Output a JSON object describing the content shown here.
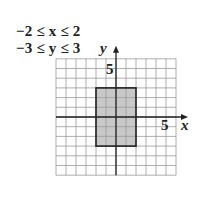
{
  "constraints": [
    {
      "text": "−2 ≤ x ≤ 2",
      "var": "x",
      "lower": -2,
      "upper": 2
    },
    {
      "text": "−3 ≤ y ≤ 3",
      "var": "y",
      "lower": -3,
      "upper": 3
    }
  ],
  "axes": {
    "x_label": "x",
    "y_label": "y",
    "x_tick_label": "5",
    "y_tick_label": "5"
  },
  "grid": {
    "x_range": [
      -6,
      6
    ],
    "y_range": [
      -6,
      6
    ],
    "step": 1
  },
  "shaded_region": {
    "x": [
      -2,
      2
    ],
    "y": [
      -3,
      3
    ],
    "fill": "#c8c8c8",
    "stroke": "#222222"
  }
}
